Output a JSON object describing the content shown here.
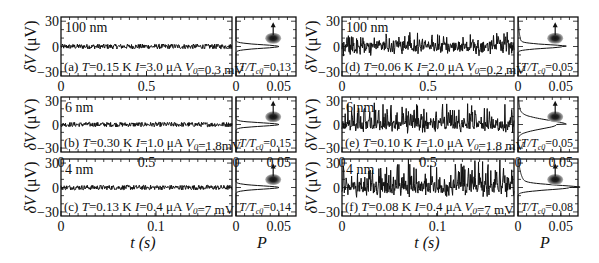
{
  "figure": {
    "ylabel": "δV (μV)",
    "yticks": [
      "30",
      "0",
      "−30"
    ],
    "hist_xlabel": "P",
    "hist_xticks": [
      "0",
      "0.05"
    ]
  },
  "columns": [
    {
      "id": "left",
      "xlabel": "t (s)",
      "rows": [
        {
          "xticks": [
            "0",
            "0.5"
          ],
          "xtick_pos": [
            0,
            0.5
          ],
          "xrange": [
            0,
            1.0
          ]
        },
        {
          "xticks": [
            "0",
            "0.5"
          ],
          "xtick_pos": [
            0,
            0.5
          ],
          "xrange": [
            0,
            1.0
          ]
        },
        {
          "xticks": [
            "0",
            "0.1"
          ],
          "xtick_pos": [
            0,
            0.1
          ],
          "xrange": [
            0,
            0.18
          ]
        }
      ]
    },
    {
      "id": "right",
      "xlabel": "t (s)",
      "rows": [
        {
          "xticks": [
            "0",
            "0.5"
          ],
          "xtick_pos": [
            0,
            0.5
          ],
          "xrange": [
            0,
            1.0
          ]
        },
        {
          "xticks": [
            "0",
            "0.5"
          ],
          "xtick_pos": [
            0,
            0.5
          ],
          "xrange": [
            0,
            1.0
          ]
        },
        {
          "xticks": [
            "0",
            "0.1"
          ],
          "xtick_pos": [
            0,
            0.1
          ],
          "xrange": [
            0,
            0.18
          ]
        }
      ]
    }
  ],
  "chart_data": {
    "type": "line",
    "title": "",
    "xlabel": "t (s)",
    "ylabel": "δV (μV)",
    "ylim": [
      -35,
      35
    ],
    "hist_xlabel": "P",
    "hist_xlim": [
      0,
      0.07
    ],
    "panels": [
      {
        "label": "(a)",
        "thickness": "100 nm",
        "T": "0.15 K",
        "I": "3.0 μA",
        "V0": "0.3 mV",
        "T_over_Tc0": "0.13",
        "xlim": [
          0,
          1.0
        ],
        "noise_amplitude_uV": 3,
        "burst_amplitude_uV": 0,
        "hist_peak": 0.05,
        "hist_width": 3,
        "hist_tail": 0
      },
      {
        "label": "(b)",
        "thickness": "6 nm",
        "T": "0.30 K",
        "I": "1.0 μA",
        "V0": "1.8mV",
        "T_over_Tc0": "0.15",
        "xlim": [
          0,
          1.0
        ],
        "noise_amplitude_uV": 3,
        "burst_amplitude_uV": 0,
        "hist_peak": 0.05,
        "hist_width": 3,
        "hist_tail": 0
      },
      {
        "label": "(c)",
        "thickness": "4 nm",
        "T": "0.13 K",
        "I": "0.4 μA",
        "V0": "7 mV",
        "T_over_Tc0": "0.14",
        "xlim": [
          0,
          0.18
        ],
        "noise_amplitude_uV": 3,
        "burst_amplitude_uV": 0,
        "hist_peak": 0.05,
        "hist_width": 3,
        "hist_tail": 0
      },
      {
        "label": "(d)",
        "thickness": "100 nm",
        "T": "0.06 K",
        "I": "2.0 μA",
        "V0": "0.2 mV",
        "T_over_Tc0": "0.05",
        "xlim": [
          0,
          1.0
        ],
        "noise_amplitude_uV": 6,
        "burst_amplitude_uV": 12,
        "hist_peak": 0.052,
        "hist_width": 3,
        "hist_tail": 0.3
      },
      {
        "label": "(e)",
        "thickness": "6 nm",
        "T": "0.10 K",
        "I": "1.0 μA",
        "V0": "1.8 mV",
        "T_over_Tc0": "0.05",
        "xlim": [
          0,
          1.0
        ],
        "noise_amplitude_uV": 6,
        "burst_amplitude_uV": 25,
        "hist_peak": 0.045,
        "hist_width": 8,
        "hist_tail": 0.6
      },
      {
        "label": "(f)",
        "thickness": "4 nm",
        "T": "0.08 K",
        "I": "0.4 μA",
        "V0": "7 mV",
        "T_over_Tc0": "0.08",
        "xlim": [
          0,
          0.18
        ],
        "noise_amplitude_uV": 7,
        "burst_amplitude_uV": 30,
        "hist_peak": 0.06,
        "hist_width": 4,
        "hist_tail": 0.7
      }
    ]
  }
}
